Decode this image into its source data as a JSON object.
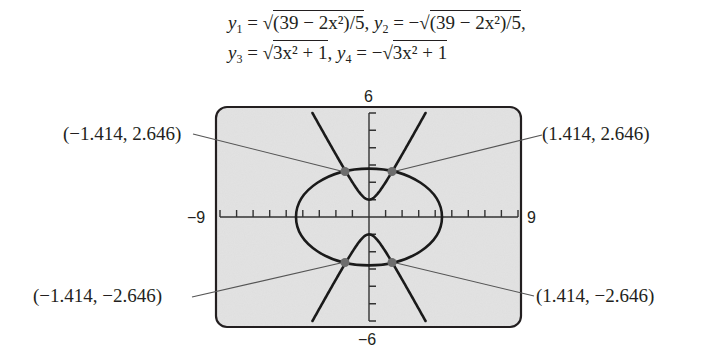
{
  "equations": {
    "line1": {
      "y1_lhs": "y",
      "y1_sub": "1",
      "y1_rhs_pre": " = √",
      "y1_rad": "(39 − 2x²)/5",
      "sep": ",  ",
      "y2_lhs": "y",
      "y2_sub": "2",
      "y2_rhs_pre": " = −√",
      "y2_rad": "(39 − 2x²)/5",
      "end": ","
    },
    "line2": {
      "y3_lhs": "y",
      "y3_sub": "3",
      "y3_rhs_pre": " = √",
      "y3_rad": "3x² + 1",
      "sep": ",  ",
      "y4_lhs": "y",
      "y4_sub": "4",
      "y4_rhs_pre": " = −√",
      "y4_rad": "3x² + 1"
    }
  },
  "window": {
    "ymax_label": "6",
    "ymin_label": "−6",
    "xmin_label": "−9",
    "xmax_label": "9"
  },
  "points": [
    {
      "label": "(−1.414, 2.646)"
    },
    {
      "label": "(1.414, 2.646)"
    },
    {
      "label": "(−1.414, −2.646)"
    },
    {
      "label": "(1.414, −2.646)"
    }
  ],
  "colors": {
    "screen_bg": "#e3e3e3",
    "frame": "#231f20",
    "curve": "#1a1a1a",
    "point": "#6d6d6d",
    "leader": "#555555"
  },
  "chart_data": {
    "type": "line",
    "xlabel": "",
    "ylabel": "",
    "xlim": [
      -9,
      9
    ],
    "ylim": [
      -6,
      6
    ],
    "xticks_step": 1,
    "yticks_step": 1,
    "grid": false,
    "series": [
      {
        "name": "y1",
        "expr": "sqrt((39 - 2x^2)/5)",
        "domain": [
          -4.416,
          4.416
        ]
      },
      {
        "name": "y2",
        "expr": "-sqrt((39 - 2x^2)/5)",
        "domain": [
          -4.416,
          4.416
        ]
      },
      {
        "name": "y3",
        "expr": "sqrt(3x^2 + 1)",
        "domain": [
          -3.416,
          3.416
        ]
      },
      {
        "name": "y4",
        "expr": "-sqrt(3x^2 + 1)",
        "domain": [
          -3.416,
          3.416
        ]
      }
    ],
    "intersection_points": [
      {
        "x": -1.414,
        "y": 2.646
      },
      {
        "x": 1.414,
        "y": 2.646
      },
      {
        "x": -1.414,
        "y": -2.646
      },
      {
        "x": 1.414,
        "y": -2.646
      }
    ],
    "annotations": [
      "(−1.414, 2.646)",
      "(1.414, 2.646)",
      "(−1.414, −2.646)",
      "(1.414, −2.646)"
    ]
  }
}
